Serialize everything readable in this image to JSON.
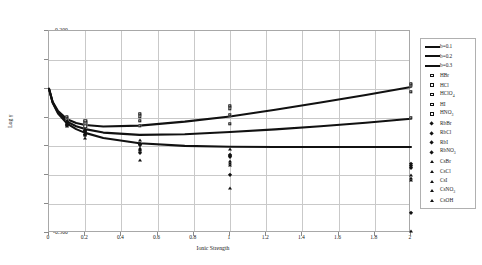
{
  "chart_data": {
    "type": "scatter",
    "title": "",
    "xlabel": "Ionic Strength",
    "ylabel": "Log γ",
    "xlim": [
      0,
      2
    ],
    "ylim": [
      -0.5,
      0.2
    ],
    "xticks": [
      "0",
      "0.2",
      "0.4",
      "0.6",
      "0.8",
      "1",
      "1.2",
      "1.4",
      "1.6",
      "1.8",
      "2"
    ],
    "yticks": [
      "0.200",
      "0.100",
      "0.000",
      "-0.100",
      "-0.200",
      "-0.300",
      "-0.400",
      "-0.500"
    ],
    "grid": true,
    "legend_position": "right-outside",
    "curves": [
      {
        "name": "b=0.1",
        "marker": "line",
        "x": [
          0,
          0.02,
          0.05,
          0.1,
          0.15,
          0.2,
          0.3,
          0.5,
          0.75,
          1.0,
          1.25,
          1.5,
          1.75,
          2.0
        ],
        "y": [
          0.0,
          -0.045,
          -0.077,
          -0.106,
          -0.119,
          -0.126,
          -0.131,
          -0.128,
          -0.114,
          -0.096,
          -0.073,
          -0.048,
          -0.022,
          0.006
        ]
      },
      {
        "name": "b=0.2",
        "marker": "line",
        "x": [
          0,
          0.02,
          0.05,
          0.1,
          0.15,
          0.2,
          0.3,
          0.5,
          0.75,
          1.0,
          1.25,
          1.5,
          1.75,
          2.0
        ],
        "y": [
          0.0,
          -0.047,
          -0.082,
          -0.114,
          -0.13,
          -0.14,
          -0.152,
          -0.16,
          -0.158,
          -0.15,
          -0.141,
          -0.13,
          -0.118,
          -0.104
        ]
      },
      {
        "name": "b=0.3",
        "marker": "line",
        "x": [
          0,
          0.02,
          0.05,
          0.1,
          0.15,
          0.2,
          0.3,
          0.5,
          0.75,
          1.0,
          1.25,
          1.5,
          1.75,
          2.0
        ],
        "y": [
          0.0,
          -0.049,
          -0.086,
          -0.121,
          -0.14,
          -0.153,
          -0.171,
          -0.189,
          -0.198,
          -0.201,
          -0.202,
          -0.202,
          -0.202,
          -0.202
        ]
      }
    ],
    "series": [
      {
        "name": "HBr",
        "marker": "open-square",
        "x": [
          0.1,
          0.2,
          0.5,
          1.0,
          2.0
        ],
        "y": [
          -0.102,
          -0.118,
          -0.095,
          -0.068,
          0.012
        ]
      },
      {
        "name": "HCl",
        "marker": "open-square",
        "x": [
          0.1,
          0.2,
          0.5,
          1.0,
          2.0
        ],
        "y": [
          -0.105,
          -0.124,
          -0.112,
          -0.09,
          -0.01
        ]
      },
      {
        "name": "HClO₄",
        "marker": "open-square",
        "x": [
          0.1,
          0.2,
          0.5,
          1.0,
          2.0
        ],
        "y": [
          -0.1,
          -0.115,
          -0.09,
          -0.063,
          0.014
        ]
      },
      {
        "name": "HI",
        "marker": "open-square",
        "x": [
          0.1,
          0.2,
          0.5,
          1.0,
          2.0
        ],
        "y": [
          -0.098,
          -0.112,
          -0.088,
          -0.06,
          0.016
        ]
      },
      {
        "name": "HNO₃",
        "marker": "open-square",
        "x": [
          0.1,
          0.2,
          0.5,
          1.0,
          2.0
        ],
        "y": [
          -0.108,
          -0.13,
          -0.128,
          -0.122,
          -0.1
        ]
      },
      {
        "name": "RbBr",
        "marker": "filled-diamond",
        "x": [
          0.1,
          0.2,
          0.5,
          1.0,
          2.0
        ],
        "y": [
          -0.118,
          -0.148,
          -0.194,
          -0.232,
          -0.268
        ]
      },
      {
        "name": "RbCl",
        "marker": "filled-diamond",
        "x": [
          0.1,
          0.2,
          0.5,
          1.0,
          2.0
        ],
        "y": [
          -0.12,
          -0.15,
          -0.196,
          -0.236,
          -0.274
        ]
      },
      {
        "name": "RbI",
        "marker": "filled-diamond",
        "x": [
          0.1,
          0.2,
          0.5,
          1.0,
          2.0
        ],
        "y": [
          -0.116,
          -0.145,
          -0.19,
          -0.228,
          -0.262
        ]
      },
      {
        "name": "RbNO₃",
        "marker": "filled-diamond",
        "x": [
          0.1,
          0.2,
          0.5,
          1.0,
          2.0
        ],
        "y": [
          -0.126,
          -0.162,
          -0.224,
          -0.3,
          -0.43
        ]
      },
      {
        "name": "CsBr",
        "marker": "filled-triangle",
        "x": [
          0.1,
          0.2,
          0.5,
          1.0,
          2.0
        ],
        "y": [
          -0.122,
          -0.155,
          -0.206,
          -0.252,
          -0.3
        ]
      },
      {
        "name": "CsCl",
        "marker": "filled-triangle",
        "x": [
          0.1,
          0.2,
          0.5,
          1.0,
          2.0
        ],
        "y": [
          -0.124,
          -0.158,
          -0.21,
          -0.258,
          -0.308
        ]
      },
      {
        "name": "CsI",
        "marker": "filled-triangle",
        "x": [
          0.1,
          0.2,
          0.5,
          1.0,
          2.0
        ],
        "y": [
          -0.126,
          -0.16,
          -0.214,
          -0.264,
          -0.318
        ]
      },
      {
        "name": "CsNO₃",
        "marker": "filled-triangle",
        "x": [
          0.1,
          0.2,
          0.5,
          1.0,
          2.0
        ],
        "y": [
          -0.13,
          -0.17,
          -0.248,
          -0.344,
          -0.492
        ]
      },
      {
        "name": "CsOH",
        "marker": "filled-triangle",
        "x": [
          0.1,
          0.2,
          0.5,
          1.0
        ],
        "y": [
          -0.112,
          -0.138,
          -0.178,
          -0.21
        ]
      }
    ]
  },
  "legend": {
    "entries": [
      {
        "label": "b=0.1",
        "marker": "line"
      },
      {
        "label": "b=0.2",
        "marker": "line"
      },
      {
        "label": "b=0.3",
        "marker": "line"
      },
      {
        "label": "HBr",
        "marker": "open-square"
      },
      {
        "label": "HCl",
        "marker": "open-square"
      },
      {
        "label": "HClO₄",
        "marker": "open-square"
      },
      {
        "label": "HI",
        "marker": "open-square"
      },
      {
        "label": "HNO₃",
        "marker": "open-square"
      },
      {
        "label": "RbBr",
        "marker": "filled-diamond"
      },
      {
        "label": "RbCl",
        "marker": "filled-diamond"
      },
      {
        "label": "RbI",
        "marker": "filled-diamond"
      },
      {
        "label": "RbNO₃",
        "marker": "filled-diamond"
      },
      {
        "label": "CsBr",
        "marker": "filled-triangle"
      },
      {
        "label": "CsCl",
        "marker": "filled-triangle"
      },
      {
        "label": "CsI",
        "marker": "filled-triangle"
      },
      {
        "label": "CsNO₃",
        "marker": "filled-triangle"
      },
      {
        "label": "CsOH",
        "marker": "filled-triangle"
      }
    ]
  },
  "colors": {
    "line": "#111111",
    "grid": "#c9c9c9",
    "frame": "#a8a8a8",
    "text": "#1a1a1a"
  }
}
